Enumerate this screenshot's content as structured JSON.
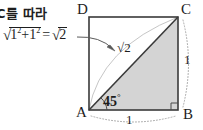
{
  "note": {
    "text": "C를 따라"
  },
  "formula": {
    "radical_glyph": "√",
    "term1": "1",
    "exponent1": "2",
    "plus": "+",
    "term2": "1",
    "exponent2": "2",
    "equals": "=",
    "result_radical_glyph": "√",
    "result": "2"
  },
  "diagram": {
    "type": "geometry",
    "shape": "square-with-diagonal",
    "vertices": [
      {
        "name": "D",
        "label": "D",
        "x": 89,
        "y": 17
      },
      {
        "name": "C",
        "label": "C",
        "x": 178,
        "y": 17
      },
      {
        "name": "A",
        "label": "A",
        "x": 89,
        "y": 110
      },
      {
        "name": "B",
        "label": "B",
        "x": 178,
        "y": 110
      }
    ],
    "labels": {
      "angle": "45",
      "angle_unit": "°",
      "diagonal": "√2",
      "side_right": "1",
      "side_bottom": "1"
    },
    "colors": {
      "stroke": "#3a3a3a",
      "triangle_fill": "#d4d4d4",
      "dotted": "#a8a8a8",
      "arc": "#bdbdbd",
      "arrow": "#5a5a5a",
      "text": "#1d1d1d"
    }
  }
}
